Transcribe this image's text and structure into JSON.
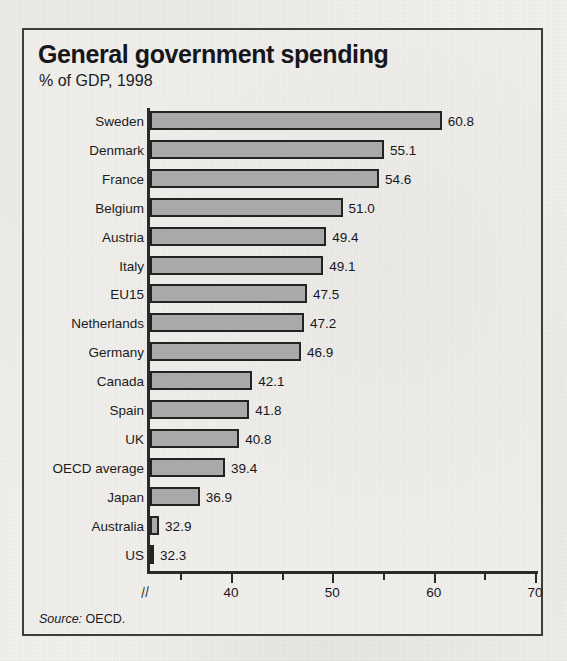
{
  "frame": {
    "source_label": "Source:",
    "source_value": "OECD."
  },
  "chart_data": {
    "type": "bar",
    "orientation": "horizontal",
    "title": "General government spending",
    "subtitle": "% of GDP, 1998",
    "xlabel": "",
    "ylabel": "",
    "xlim": [
      32,
      70
    ],
    "axis_break": "//",
    "grid": false,
    "legend": "none",
    "bar_color": "#a9a9a9",
    "bar_border_color": "#232323",
    "x_ticks_major": [
      40,
      50,
      60,
      70
    ],
    "x_tick_labels": [
      "40",
      "50",
      "60",
      "70"
    ],
    "x_ticks_minor": [
      35,
      45,
      55,
      65
    ],
    "categories": [
      "Sweden",
      "Denmark",
      "France",
      "Belgium",
      "Austria",
      "Italy",
      "EU15",
      "Netherlands",
      "Germany",
      "Canada",
      "Spain",
      "UK",
      "OECD average",
      "Japan",
      "Australia",
      "US"
    ],
    "values": [
      60.8,
      55.1,
      54.6,
      51.0,
      49.4,
      49.1,
      47.5,
      47.2,
      46.9,
      42.1,
      41.8,
      40.8,
      39.4,
      36.9,
      32.9,
      32.3
    ],
    "value_labels": [
      "60.8",
      "55.1",
      "54.6",
      "51.0",
      "49.4",
      "49.1",
      "47.5",
      "47.2",
      "46.9",
      "42.1",
      "41.8",
      "40.8",
      "39.4",
      "36.9",
      "32.9",
      "32.3"
    ],
    "source": "Source: OECD."
  }
}
